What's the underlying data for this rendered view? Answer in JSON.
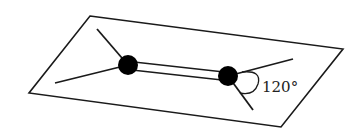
{
  "diagram": {
    "angle_label": "120°",
    "colors": {
      "line": "#1a1a1a",
      "atom": "#000000",
      "background": "#ffffff"
    },
    "plane": {
      "points": "90,16 343,49 281,127 29,93"
    },
    "atoms": [
      {
        "name": "left-atom",
        "cx": 128,
        "cy": 65,
        "r": 10
      },
      {
        "name": "right-atom",
        "cx": 228,
        "cy": 76,
        "r": 10
      }
    ],
    "bonds": [
      {
        "name": "left-upper-bond",
        "x1": 128,
        "y1": 65,
        "x2": 97,
        "y2": 29
      },
      {
        "name": "left-lower-bond",
        "x1": 128,
        "y1": 65,
        "x2": 55,
        "y2": 83
      },
      {
        "name": "right-upper-bond",
        "x1": 228,
        "y1": 76,
        "x2": 293,
        "y2": 59
      },
      {
        "name": "right-lower-bond",
        "x1": 228,
        "y1": 76,
        "x2": 253,
        "y2": 110
      }
    ],
    "double_bond": [
      {
        "x1": 134,
        "y1": 62,
        "x2": 224,
        "y2": 72
      },
      {
        "x1": 132,
        "y1": 70,
        "x2": 222,
        "y2": 80
      }
    ]
  }
}
